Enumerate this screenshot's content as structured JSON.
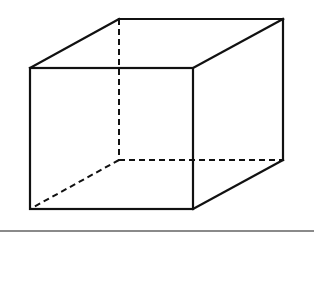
{
  "diagram": {
    "type": "cube-wireframe",
    "stroke_color": "#111111",
    "baseline_color": "#8a8a8a",
    "vertices": {
      "front_top_left": [
        30,
        68
      ],
      "front_top_right": [
        193,
        68
      ],
      "front_bottom_left": [
        30,
        209
      ],
      "front_bottom_right": [
        193,
        209
      ],
      "back_top_left": [
        119,
        19
      ],
      "back_top_right": [
        283,
        19
      ],
      "back_bottom_left": [
        119,
        160
      ],
      "back_bottom_right": [
        283,
        160
      ]
    },
    "solid_edges": 9,
    "dashed_edges": 3,
    "baseline_y": 231
  }
}
